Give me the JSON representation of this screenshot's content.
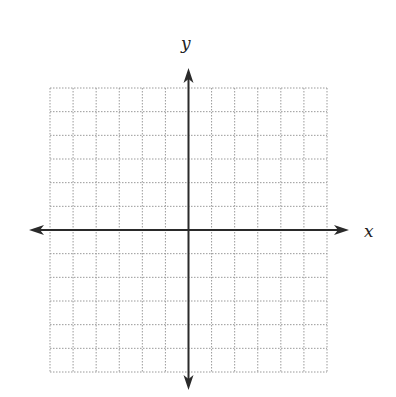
{
  "diagram": {
    "type": "coordinate-plane",
    "x_axis_label": "x",
    "y_axis_label": "y",
    "grid": {
      "columns": 12,
      "rows": 12,
      "left": 50,
      "top": 88,
      "right": 327,
      "bottom": 372,
      "line_style": "dotted",
      "line_color": "#9a9a9a"
    },
    "origin_col": 6,
    "origin_row": 6,
    "x_range": [
      -6,
      6
    ],
    "y_range": [
      -6,
      6
    ],
    "axis_color": "#2a2a2a",
    "arrows": {
      "left_tip_x": 29,
      "right_tip_x": 349,
      "top_tip_y": 68,
      "bottom_tip_y": 390
    }
  }
}
